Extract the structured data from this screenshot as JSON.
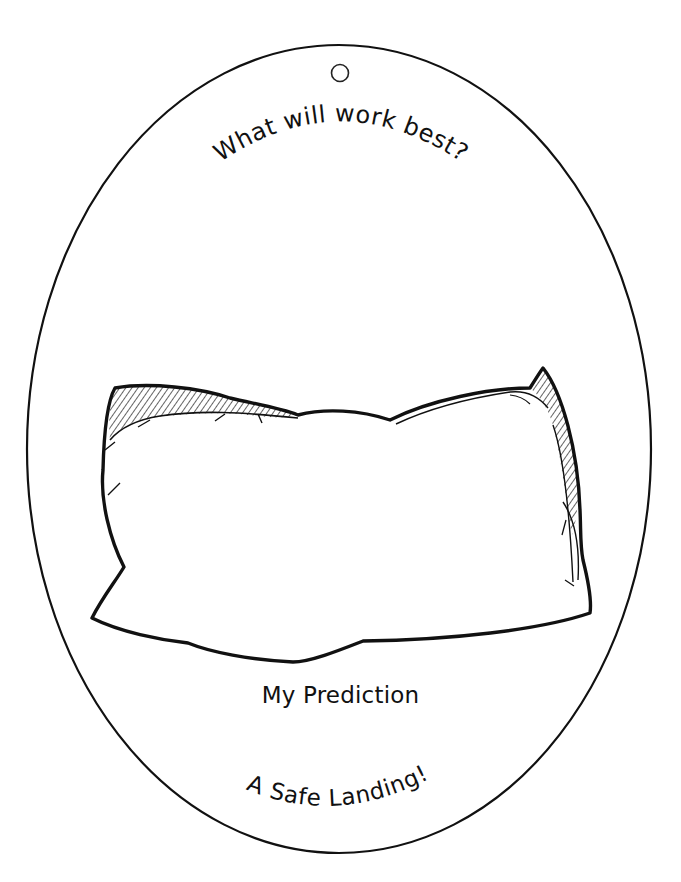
{
  "card": {
    "shape": "oval",
    "outline_color": "#111111",
    "background_color": "#ffffff",
    "center": [
      339,
      449
    ],
    "radius_x": 312,
    "radius_y": 404,
    "hang_hole": {
      "center": [
        340,
        73
      ],
      "radius": 9
    }
  },
  "header": {
    "question": "What will work best?"
  },
  "illustration": {
    "subject": "pillow",
    "style": "black line art with hatched shading"
  },
  "labels": {
    "prediction": "My Prediction",
    "title": "A Safe Landing!"
  }
}
